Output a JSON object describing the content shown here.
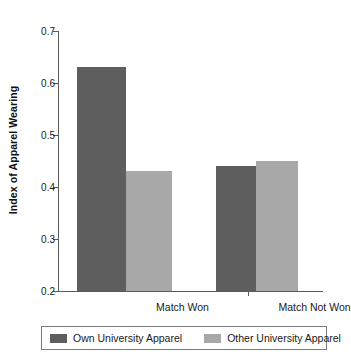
{
  "chart_data": {
    "type": "bar",
    "title": "",
    "xlabel": "",
    "ylabel": "Index of Apparel Wearing",
    "categories": [
      "Match Won",
      "Match Not Won"
    ],
    "series": [
      {
        "name": "Own University Apparel",
        "color": "#5e5e5e",
        "values": [
          0.63,
          0.44
        ]
      },
      {
        "name": "Other University Apparel",
        "color": "#a8a8a8",
        "values": [
          0.43,
          0.45
        ]
      }
    ],
    "ylim": [
      0.2,
      0.7
    ],
    "ytick_labels": [
      "0.7",
      "0.6",
      "0.5",
      "0.4",
      "0.3",
      "0.2"
    ],
    "ytick_values": [
      0.7,
      0.6,
      0.5,
      0.4,
      0.3,
      0.2
    ],
    "ytick_step": 0.1,
    "grid": false,
    "legend_position": "bottom"
  },
  "axis": {
    "y_title": "Index of Apparel Wearing"
  },
  "legend": {
    "entries": [
      {
        "label": "Own University Apparel"
      },
      {
        "label": "Other University Apparel"
      }
    ]
  }
}
